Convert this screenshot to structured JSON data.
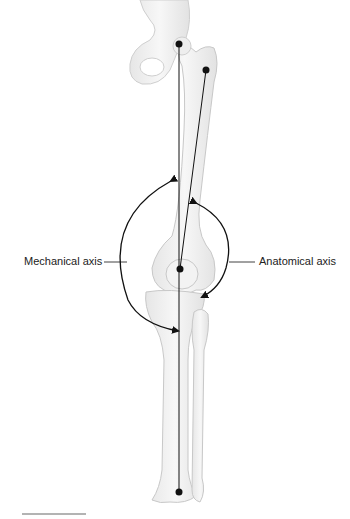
{
  "diagram": {
    "labels": {
      "mechanical": "Mechanical axis",
      "anatomical": "Anatomical axis"
    },
    "colors": {
      "bone_fill": "#f2f2f2",
      "bone_stroke": "#c8c8c8",
      "line": "#111111",
      "rule": "#9a9a9a"
    }
  }
}
